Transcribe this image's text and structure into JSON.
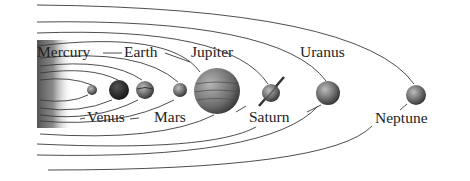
{
  "diagram": {
    "colors": {
      "background": "#ffffff",
      "orbit": "#3a3a3a",
      "sun_dark": "#5a5a5a",
      "sun_light": "#ffffff",
      "label": "#222222"
    },
    "sun": {
      "name": "Sun",
      "x": 37,
      "y": 40,
      "width": 36,
      "height": 88
    },
    "planets": [
      {
        "name": "Mercury",
        "cx": 92,
        "cy": 90,
        "r": 5,
        "fill": "#8a8a8a",
        "label_pos": "top",
        "label_x": 37,
        "label_y": 44
      },
      {
        "name": "Venus",
        "cx": 119,
        "cy": 90,
        "r": 10,
        "fill": "#2a2a2a",
        "label_pos": "bottom",
        "label_x": 86,
        "label_y": 109
      },
      {
        "name": "Earth",
        "cx": 145,
        "cy": 90,
        "r": 9,
        "fill": "#6e6e6e",
        "label_pos": "top",
        "label_x": 124,
        "label_y": 44
      },
      {
        "name": "Mars",
        "cx": 180,
        "cy": 90,
        "r": 7,
        "fill": "#5a5a5a",
        "label_pos": "bottom",
        "label_x": 154,
        "label_y": 109
      },
      {
        "name": "Jupiter",
        "cx": 217,
        "cy": 91,
        "r": 23,
        "fill": "#6a6a6a",
        "label_pos": "top",
        "label_x": 190,
        "label_y": 44
      },
      {
        "name": "Saturn",
        "cx": 271,
        "cy": 93,
        "r": 9,
        "fill": "#6a6a6a",
        "label_pos": "bottom",
        "label_x": 248,
        "label_y": 109
      },
      {
        "name": "Uranus",
        "cx": 328,
        "cy": 93,
        "r": 12,
        "fill": "#707070",
        "label_pos": "top",
        "label_x": 300,
        "label_y": 44
      },
      {
        "name": "Neptune",
        "cx": 416,
        "cy": 95,
        "r": 10,
        "fill": "#5e5e5e",
        "label_pos": "bottom",
        "label_x": 375,
        "label_y": 110
      }
    ],
    "labels": {
      "mercury": "Mercury",
      "venus": "Venus",
      "earth": "Earth",
      "mars": "Mars",
      "jupiter": "Jupiter",
      "saturn": "Saturn",
      "uranus": "Uranus",
      "neptune": "Neptune"
    }
  }
}
